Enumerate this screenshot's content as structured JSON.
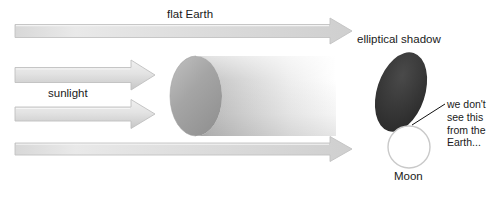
{
  "diagram": {
    "background_color": "#ffffff",
    "width": 494,
    "height": 198,
    "labels": {
      "flat_earth": "flat Earth",
      "sunlight": "sunlight",
      "elliptical_shadow": "elliptical shadow",
      "moon": "Moon"
    },
    "annotation": {
      "line1": "we don't",
      "line2": "see this",
      "line3": "from the",
      "line4": "Earth..."
    },
    "colors": {
      "arrow_fill_light": "#ececec",
      "arrow_fill_dark": "#c9c9c9",
      "arrow_stroke": "#bdbdbd",
      "cylinder_face": "#9a9a9a",
      "cylinder_body_start": "#b4b4b4",
      "cylinder_body_end": "#ffffff",
      "shadow_ellipse_dark": "#3b3b3b",
      "shadow_ellipse_darkest": "#2a2a2a",
      "moon_outline": "#c8c8c8",
      "moon_fill": "#ffffff",
      "text": "#1a1a1a",
      "leader_line": "#111111"
    },
    "arrows": [
      {
        "name": "flat-earth-ray",
        "x1": 15,
        "x2": 352,
        "y": 31,
        "thickness": 13,
        "head_width": 22,
        "head_height": 27
      },
      {
        "name": "sunlight-ray-upper",
        "x1": 15,
        "x2": 155,
        "y": 75,
        "thickness": 15,
        "head_width": 24,
        "head_height": 30
      },
      {
        "name": "sunlight-ray-lower",
        "x1": 15,
        "x2": 155,
        "y": 114,
        "thickness": 14,
        "head_width": 24,
        "head_height": 29
      },
      {
        "name": "bottom-ray",
        "x1": 15,
        "x2": 352,
        "y": 149,
        "thickness": 12,
        "head_width": 22,
        "head_height": 26
      }
    ],
    "shadow_cylinder": {
      "name": "shadow-cylinder",
      "ellipse_center_x": 196,
      "ellipse_center_y": 96,
      "ellipse_rx": 26,
      "ellipse_ry": 40,
      "body_start_x": 196,
      "body_end_x": 336
    },
    "elliptical_shadow_shape": {
      "name": "elliptical-shadow",
      "center_x": 401,
      "center_y": 92,
      "rx": 24,
      "ry": 41,
      "rotation_deg": 18
    },
    "moon_shape": {
      "name": "moon-circle",
      "center_x": 409,
      "center_y": 147,
      "radius": 21
    },
    "leader_line": {
      "name": "annotation-leader-line",
      "x1": 444,
      "y1": 105,
      "x2": 412,
      "y2": 125
    }
  }
}
